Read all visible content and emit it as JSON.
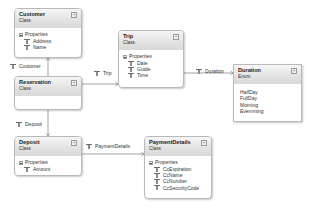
{
  "diagram": {
    "type": "class-diagram",
    "shapes": {
      "customer": {
        "name": "Customer",
        "kind": "Class",
        "section": "Properties",
        "members": [
          "Address",
          "Name"
        ]
      },
      "reservation": {
        "name": "Reservation",
        "kind": "Class"
      },
      "deposit": {
        "name": "Deposit",
        "kind": "Class",
        "section": "Properties",
        "members": [
          "Amount"
        ]
      },
      "trip": {
        "name": "Trip",
        "kind": "Class",
        "section": "Properties",
        "members": [
          "Date",
          "Guide",
          "Time"
        ]
      },
      "duration": {
        "name": "Duration",
        "kind": "Enum",
        "values": [
          "HalfDay",
          "FullDay",
          "Morning",
          "Evennning"
        ]
      },
      "payment_details": {
        "name": "PaymentDetails",
        "kind": "Class",
        "section": "Properties",
        "members": [
          "CcExpiration",
          "CcName",
          "CcNumber",
          "CcSecurityCode"
        ]
      }
    },
    "associations": [
      {
        "label": "Customer",
        "from": "Reservation",
        "to": "Customer"
      },
      {
        "label": "Trip",
        "from": "Reservation",
        "to": "Trip"
      },
      {
        "label": "Duration",
        "from": "Trip",
        "to": "Duration"
      },
      {
        "label": "Deposit",
        "from": "Reservation",
        "to": "Deposit"
      },
      {
        "label": "PaymentDetails",
        "from": "Deposit",
        "to": "PaymentDetails"
      }
    ],
    "collapse_glyph": "«",
    "colors": {
      "border": "#b9b9b9",
      "header_top": "#f6f6f6",
      "header_bottom": "#d8d8d8",
      "connector": "#8c8c8c"
    }
  }
}
